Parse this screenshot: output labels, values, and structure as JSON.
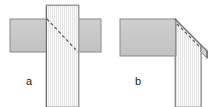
{
  "figure": {
    "canvas": {
      "width": 214,
      "height": 107,
      "background": "#ffffff"
    },
    "colors": {
      "solid_fill": "#c8c8c8",
      "hatched_fill": "#f7f7f7",
      "hatch_line": "#dcdcdc",
      "outline": "#7a7a7a",
      "outline_dark": "#5a5a5a",
      "dashed_line": "#555555",
      "bevel_fill": "#e2e2e2",
      "label_color": "#1a1a1a"
    },
    "panels": [
      {
        "id": "a",
        "label": "a",
        "label_x": 29,
        "label_y": 85,
        "parts": [
          {
            "name": "left-plate",
            "shape": "rect",
            "x": 10,
            "y": 19,
            "w": 37,
            "h": 33,
            "fill": "solid"
          },
          {
            "name": "right-plate",
            "shape": "rect",
            "x": 78,
            "y": 19,
            "w": 23,
            "h": 33,
            "fill": "solid"
          },
          {
            "name": "vertical-member",
            "shape": "rect",
            "x": 46,
            "y": 5,
            "w": 33,
            "h": 102,
            "fill": "hatched"
          },
          {
            "name": "cut-line",
            "shape": "dashed-line",
            "x1": 47,
            "y1": 19,
            "x2": 78,
            "y2": 52
          }
        ]
      },
      {
        "id": "b",
        "label": "b",
        "label_x": 138,
        "label_y": 85,
        "parts": [
          {
            "name": "left-plate",
            "shape": "rect",
            "x": 120,
            "y": 19,
            "w": 58,
            "h": 37,
            "fill": "solid"
          },
          {
            "name": "vertical-member",
            "shape": "polygon",
            "points": "175,19 207,51 207,107 175,107",
            "fill": "hatched"
          },
          {
            "name": "bevel-face",
            "shape": "polygon",
            "points": "175,19 207,51 207,58 200,58 175,26",
            "fill": "bevel"
          },
          {
            "name": "cut-line",
            "shape": "dashed-line",
            "x1": 176,
            "y1": 25,
            "x2": 200,
            "y2": 49
          }
        ]
      }
    ],
    "labels": {
      "panel_a": "a",
      "panel_b": "b"
    }
  }
}
